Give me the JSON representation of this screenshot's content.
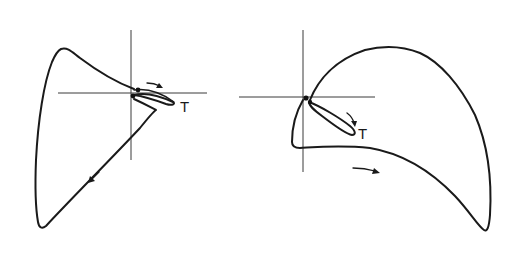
{
  "diagram": {
    "type": "loop-diagram-pair",
    "stroke_color": "#1a1a1a",
    "axis_color": "#3a3a3a",
    "background": "#ffffff",
    "panels": [
      {
        "id": "left",
        "label": "T",
        "origin": [
          131,
          93
        ],
        "arrows": [
          {
            "position": "upper-right near origin",
            "direction": "right"
          },
          {
            "position": "lower-left diagonal",
            "direction": "down-left"
          }
        ]
      },
      {
        "id": "right",
        "label": "T",
        "origin": [
          305,
          97
        ],
        "arrows": [
          {
            "position": "along inner loop",
            "direction": "down-right"
          },
          {
            "position": "below lower branch",
            "direction": "right"
          }
        ]
      }
    ]
  }
}
